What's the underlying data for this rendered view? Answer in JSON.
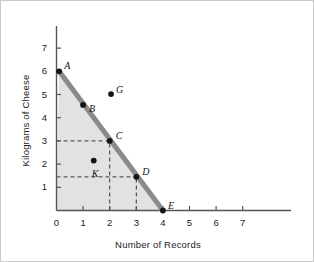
{
  "chart_data": {
    "type": "line",
    "title": "",
    "xlabel": "Number of Records",
    "ylabel": "Kilograms of Cheese",
    "xlim": [
      0,
      7.6
    ],
    "ylim": [
      0,
      7.6
    ],
    "xticks": [
      0,
      1,
      2,
      3,
      4,
      5,
      6,
      7
    ],
    "yticks": [
      1,
      2,
      3,
      4,
      5,
      6,
      7
    ],
    "grid": false,
    "legend": null,
    "series": [
      {
        "name": "production-possibilities-frontier",
        "type": "line",
        "color": "#8a8a8a",
        "x": [
          0.1,
          4.0
        ],
        "y": [
          6.0,
          0.0
        ]
      }
    ],
    "shaded_region": {
      "name": "attainable-region",
      "color": "#e2e2e2",
      "vertices": [
        [
          0,
          0
        ],
        [
          0.1,
          6.0
        ],
        [
          4.0,
          0.0
        ]
      ]
    },
    "points": [
      {
        "label": "A",
        "x": 0.1,
        "y": 6.0,
        "label_dx": 5,
        "label_dy": -11,
        "on_frontier": true
      },
      {
        "label": "B",
        "x": 1.0,
        "y": 4.55,
        "label_dx": 6,
        "label_dy": -2,
        "on_frontier": true
      },
      {
        "label": "G",
        "x": 2.05,
        "y": 5.02,
        "label_dx": 5,
        "label_dy": -10,
        "on_frontier": false
      },
      {
        "label": "C",
        "x": 2.0,
        "y": 3.0,
        "label_dx": 6,
        "label_dy": -11,
        "on_frontier": true
      },
      {
        "label": "K",
        "x": 1.4,
        "y": 2.15,
        "label_dx": -2,
        "label_dy": 7,
        "on_frontier": false
      },
      {
        "label": "D",
        "x": 3.0,
        "y": 1.45,
        "label_dx": 6,
        "label_dy": -11,
        "on_frontier": true
      },
      {
        "label": "E",
        "x": 4.0,
        "y": 0.0,
        "label_dx": 5,
        "label_dy": -11,
        "on_frontier": true
      }
    ],
    "guide_lines": [
      {
        "name": "c-horizontal-guide",
        "from": [
          0,
          3.0
        ],
        "to": [
          2.0,
          3.0
        ],
        "style": "dashed"
      },
      {
        "name": "c-vertical-guide",
        "from": [
          2.0,
          0
        ],
        "to": [
          2.0,
          3.0
        ],
        "style": "dashed"
      },
      {
        "name": "d-horizontal-guide",
        "from": [
          0,
          1.45
        ],
        "to": [
          3.0,
          1.45
        ],
        "style": "dashed"
      },
      {
        "name": "d-vertical-guide",
        "from": [
          3.0,
          0
        ],
        "to": [
          3.0,
          1.45
        ],
        "style": "dashed"
      }
    ]
  },
  "colors": {
    "frontier": "#8a8a8a",
    "shade": "#e2e2e2",
    "axis": "#555555",
    "point": "#141414",
    "text": "#1c1c1c",
    "border": "#c9c9c9"
  }
}
